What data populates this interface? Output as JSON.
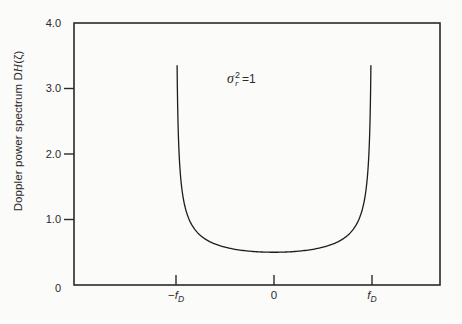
{
  "figure": {
    "background": "#fbfbfa",
    "ink_color": "#2a2a2a",
    "curve_color": "#1c1c1c"
  },
  "chart_data": {
    "type": "line",
    "title": "",
    "xlabel": "",
    "ylabel_prefix": "Doppler power spectrum ",
    "ylabel_symbol_D": "D",
    "ylabel_symbol_H": "H",
    "ylabel_symbol_arg": "(ζ)",
    "ylim": [
      0,
      4.0
    ],
    "y_ticks": [
      0,
      1.0,
      2.0,
      3.0,
      4.0
    ],
    "y_tick_labels": [
      "0",
      "1.0",
      "2.0",
      "3.0",
      "4.0"
    ],
    "x_tick_values": [
      -1,
      0,
      1
    ],
    "x_tick_labels": [
      {
        "prefix": "−",
        "sym": "f",
        "sub": "D"
      },
      {
        "sym": "0"
      },
      {
        "sym": "f",
        "sub": "D"
      }
    ],
    "annotation": {
      "sigma": "σ",
      "sup": "2",
      "sub": "r",
      "eq": "=1"
    },
    "grid": false,
    "legend": false,
    "series": [
      {
        "name": "Jakes Doppler power spectrum",
        "model": "S(u) = S0 / sqrt(1 - u^2), u = f/fD",
        "S0": 0.5,
        "clip_value": 3.35,
        "x_range_in_fD": [
          -1,
          1
        ],
        "sample_points": [
          {
            "u": -0.9888,
            "S": 3.35
          },
          {
            "u": -0.98,
            "S": 2.51
          },
          {
            "u": -0.95,
            "S": 1.6
          },
          {
            "u": -0.9,
            "S": 1.15
          },
          {
            "u": -0.8,
            "S": 0.83
          },
          {
            "u": -0.5,
            "S": 0.58
          },
          {
            "u": 0.0,
            "S": 0.5
          },
          {
            "u": 0.5,
            "S": 0.58
          },
          {
            "u": 0.8,
            "S": 0.83
          },
          {
            "u": 0.9,
            "S": 1.15
          },
          {
            "u": 0.95,
            "S": 1.6
          },
          {
            "u": 0.98,
            "S": 2.51
          },
          {
            "u": 0.9888,
            "S": 3.35
          }
        ]
      }
    ]
  }
}
